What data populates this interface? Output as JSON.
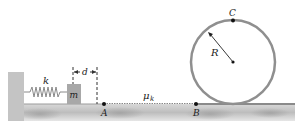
{
  "diagram": {
    "labels": {
      "spring_constant": "k",
      "mass": "m",
      "distance": "d",
      "friction": "μ",
      "friction_sub": "k",
      "point_a": "A",
      "point_b": "B",
      "point_c": "C",
      "radius": "R"
    },
    "colors": {
      "wall": "#c4c4c4",
      "floor": "#cfcfcf",
      "floor_shadow": "#a9a9a9",
      "block": "#a8a8a8",
      "loop": "#8f8f8f",
      "spring": "#8a8a8a",
      "text": "#222222"
    }
  }
}
